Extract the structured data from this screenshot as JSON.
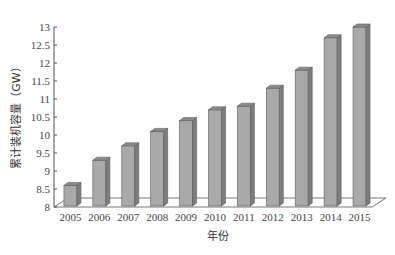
{
  "chart_data": {
    "type": "bar",
    "style": "3d-column",
    "title": "",
    "xlabel": "年份",
    "ylabel": "累计装机容量（GW）",
    "categories": [
      "2005",
      "2006",
      "2007",
      "2008",
      "2009",
      "2010",
      "2011",
      "2012",
      "2013",
      "2014",
      "2015"
    ],
    "values": [
      8.6,
      9.3,
      9.7,
      10.1,
      10.4,
      10.7,
      10.8,
      11.3,
      11.8,
      12.7,
      13.0
    ],
    "ylim": [
      8,
      13
    ],
    "yticks": [
      8,
      8.5,
      9,
      9.5,
      10,
      10.5,
      11,
      11.5,
      12,
      12.5,
      13
    ],
    "ytick_labels": [
      "8",
      "8.5",
      "9",
      "9.5",
      "10",
      "10.5",
      "11",
      "11.5",
      "12",
      "12.5",
      "13"
    ],
    "grid": false,
    "legend": null,
    "colors": {
      "bar_front": "#a9a9a9",
      "bar_side": "#7d7d7d",
      "bar_top": "#8c8c8c",
      "bar_edge": "#5a5a5a",
      "axis": "#555555"
    }
  }
}
